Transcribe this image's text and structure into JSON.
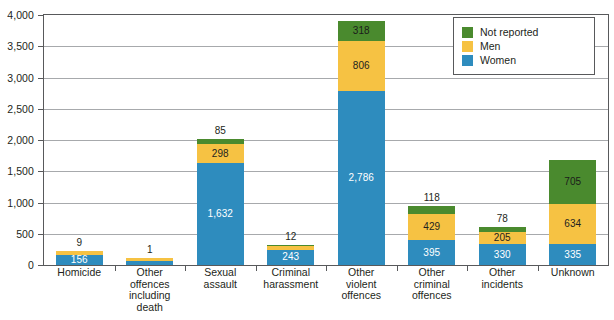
{
  "chart_data": {
    "type": "bar",
    "subtype": "stacked-bar",
    "title": "",
    "xlabel": "",
    "ylabel": "",
    "ylim": [
      0,
      4000
    ],
    "ytick_step": 500,
    "ytick_labels": [
      "4,000",
      "3,500",
      "3,000",
      "2,500",
      "2,000",
      "1,500",
      "1,000",
      "500",
      "0"
    ],
    "ytick_values": [
      4000,
      3500,
      3000,
      2500,
      2000,
      1500,
      1000,
      500,
      0
    ],
    "grid": true,
    "legend_position": "top-right",
    "categories": [
      "Homicide",
      "Other offences including death",
      "Sexual assault",
      "Criminal harassment",
      "Other violent offences",
      "Other criminal offences",
      "Other incidents",
      "Unknown"
    ],
    "category_lines": [
      [
        "Homicide"
      ],
      [
        "Other",
        "offences",
        "including",
        "death"
      ],
      [
        "Sexual",
        "assault"
      ],
      [
        "Criminal",
        "harassment"
      ],
      [
        "Other",
        "violent",
        "offences"
      ],
      [
        "Other",
        "criminal",
        "offences"
      ],
      [
        "Other",
        "incidents"
      ],
      [
        "Unknown"
      ]
    ],
    "series": [
      {
        "name": "Women",
        "color": "#2e8cbe",
        "values": [
          156,
          63,
          1632,
          243,
          2786,
          395,
          330,
          335
        ],
        "labels": [
          "156",
          "63",
          "1,632",
          "243",
          "2,786",
          "395",
          "330",
          "335"
        ]
      },
      {
        "name": "Men",
        "color": "#f6c243",
        "values": [
          61,
          51,
          298,
          61,
          806,
          429,
          205,
          634
        ],
        "labels": [
          "61",
          "51",
          "298",
          "61",
          "806",
          "429",
          "205",
          "634"
        ]
      },
      {
        "name": "Not reported",
        "color": "#4a8a2e",
        "values": [
          9,
          1,
          85,
          12,
          318,
          118,
          78,
          705
        ],
        "labels": [
          "9",
          "1",
          "85",
          "12",
          "318",
          "118",
          "78",
          "705"
        ]
      }
    ],
    "top_labels": [
      "9",
      "1",
      "85",
      "12",
      "318",
      "118",
      "78",
      "705"
    ],
    "totals": [
      226,
      115,
      2015,
      316,
      3910,
      942,
      613,
      1674
    ]
  },
  "legend": {
    "items": [
      {
        "label": "Not reported",
        "color": "#4a8a2e",
        "swatch": "green"
      },
      {
        "label": "Men",
        "color": "#f6c243",
        "swatch": "amber"
      },
      {
        "label": "Women",
        "color": "#2e8cbe",
        "swatch": "blue"
      }
    ]
  }
}
